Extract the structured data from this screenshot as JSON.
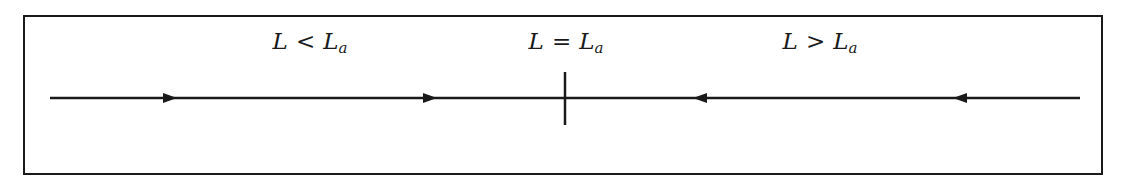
{
  "diagram": {
    "type": "phase-line",
    "regions": [
      {
        "id": "below",
        "lhs": "L",
        "op": "<",
        "rhs": "L",
        "rhs_sub": "a",
        "flow_direction": "right"
      },
      {
        "id": "equal",
        "lhs": "L",
        "op": "=",
        "rhs": "L",
        "rhs_sub": "a",
        "marker": "vertical-tick"
      },
      {
        "id": "above",
        "lhs": "L",
        "op": ">",
        "rhs": "L",
        "rhs_sub": "a",
        "flow_direction": "left"
      }
    ],
    "arrows": [
      {
        "x": 170,
        "direction": "right"
      },
      {
        "x": 430,
        "direction": "right"
      },
      {
        "x": 700,
        "direction": "left"
      },
      {
        "x": 960,
        "direction": "left"
      }
    ],
    "colors": {
      "line": "#1a1a1a",
      "background": "#ffffff"
    }
  }
}
